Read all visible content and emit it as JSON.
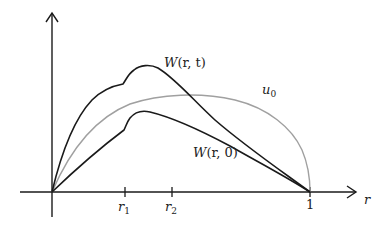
{
  "diagram": {
    "axes": {
      "x_label": "r",
      "ticks": [
        {
          "name": "r",
          "sub": "1"
        },
        {
          "name": "r",
          "sub": "2"
        },
        {
          "name": "1",
          "sub": ""
        }
      ]
    },
    "curves": [
      {
        "id": "W_rt",
        "label_prefix": "W",
        "label_args": "(r, t)",
        "color": "#1a1a1a"
      },
      {
        "id": "u0",
        "label_prefix": "u",
        "label_sub": "0",
        "color": "#a0a0a0"
      },
      {
        "id": "W_r0",
        "label_prefix": "W",
        "label_args": "(r, 0)",
        "color": "#1a1a1a"
      }
    ],
    "colors": {
      "axis": "#1a1a1a",
      "dark_curve": "#1a1a1a",
      "gray_curve": "#a0a0a0"
    }
  }
}
